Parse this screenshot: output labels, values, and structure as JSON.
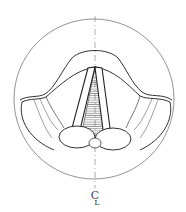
{
  "diagram": {
    "centerline_label": "C",
    "centerline_label_sub": "L",
    "colors": {
      "line": "#333333",
      "light_line": "#777777",
      "hatch": "#555555",
      "background": "#ffffff"
    }
  }
}
